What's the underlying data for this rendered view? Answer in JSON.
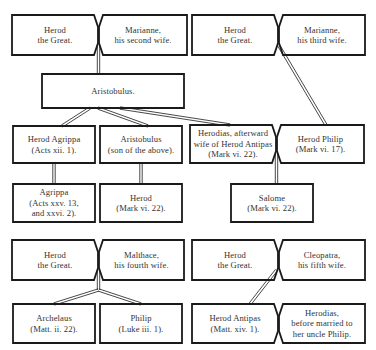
{
  "diagram": {
    "type": "genealogy",
    "nodes": [
      {
        "id": "herod1",
        "lines": [
          "Herod",
          "the Great."
        ]
      },
      {
        "id": "mariamne2",
        "lines": [
          "Marianne,",
          "his second wife."
        ]
      },
      {
        "id": "herod2",
        "lines": [
          "Herod",
          "the Great."
        ]
      },
      {
        "id": "mariamne3",
        "lines": [
          "Marianne,",
          "his third wife."
        ]
      },
      {
        "id": "aristobulus",
        "lines": [
          "Aristobulus."
        ]
      },
      {
        "id": "herod_agrippa",
        "lines": [
          "Herod Agrippa",
          "(Acts xii. 1)."
        ]
      },
      {
        "id": "aristobulus_son",
        "lines": [
          "Aristobulus",
          "(son of the above)."
        ]
      },
      {
        "id": "herodias",
        "lines": [
          "Herodias, afterward",
          "wife of Herod Antipas",
          "(Mark vi. 22)."
        ]
      },
      {
        "id": "herod_philip",
        "lines": [
          "Herod Philip",
          "(Mark vi. 17)."
        ]
      },
      {
        "id": "agrippa",
        "lines": [
          "Agrippa",
          "(Acts xxv. 13,",
          "and xxvi. 2)."
        ]
      },
      {
        "id": "herod_son",
        "lines": [
          "Herod",
          "(Mark vi. 22)."
        ]
      },
      {
        "id": "salome",
        "lines": [
          "Salome",
          "(Mark vi. 22)."
        ]
      },
      {
        "id": "herod3",
        "lines": [
          "Herod",
          "the Great."
        ]
      },
      {
        "id": "malthace",
        "lines": [
          "Malthace,",
          "his fourth wife."
        ]
      },
      {
        "id": "archelaus",
        "lines": [
          "Archelaus",
          "(Matt. ii. 22)."
        ]
      },
      {
        "id": "philip",
        "lines": [
          "Philip",
          "(Luke iii. 1)."
        ]
      },
      {
        "id": "herod4",
        "lines": [
          "Herod",
          "the Great."
        ]
      },
      {
        "id": "cleopatra",
        "lines": [
          "Cleopatra,",
          "his fifth wife."
        ]
      },
      {
        "id": "herod_antipas",
        "lines": [
          "Herod Antipas",
          "(Matt. xiv. 1)."
        ]
      },
      {
        "id": "herodias2",
        "lines": [
          "Herodias,",
          "before married to",
          "her uncle Philip."
        ]
      }
    ],
    "marriages": [
      [
        "herod1",
        "mariamne2"
      ],
      [
        "herod2",
        "mariamne3"
      ],
      [
        "herodias",
        "herod_philip"
      ],
      [
        "herod3",
        "malthace"
      ],
      [
        "herod4",
        "cleopatra"
      ],
      [
        "herod_antipas",
        "herodias2"
      ]
    ],
    "descents": [
      {
        "from": [
          "herod1",
          "mariamne2"
        ],
        "to": "aristobulus"
      },
      {
        "from": "aristobulus",
        "to": "herod_agrippa"
      },
      {
        "from": "aristobulus",
        "to": "aristobulus_son"
      },
      {
        "from": "aristobulus",
        "to": "herodias"
      },
      {
        "from": [
          "herod2",
          "mariamne3"
        ],
        "to": "herod_philip"
      },
      {
        "from": "herod_agrippa",
        "to": "agrippa"
      },
      {
        "from": "aristobulus_son",
        "to": "herod_son"
      },
      {
        "from": [
          "herodias",
          "herod_philip"
        ],
        "to": "salome"
      },
      {
        "from": [
          "herod3",
          "malthace"
        ],
        "to": "archelaus"
      },
      {
        "from": [
          "herod3",
          "malthace"
        ],
        "to": "philip"
      },
      {
        "from": [
          "herod4",
          "cleopatra"
        ],
        "to": "herod_antipas"
      }
    ],
    "colors": {
      "stroke": "#1a1a1a",
      "text": "#333333",
      "background": "#ffffff"
    }
  }
}
